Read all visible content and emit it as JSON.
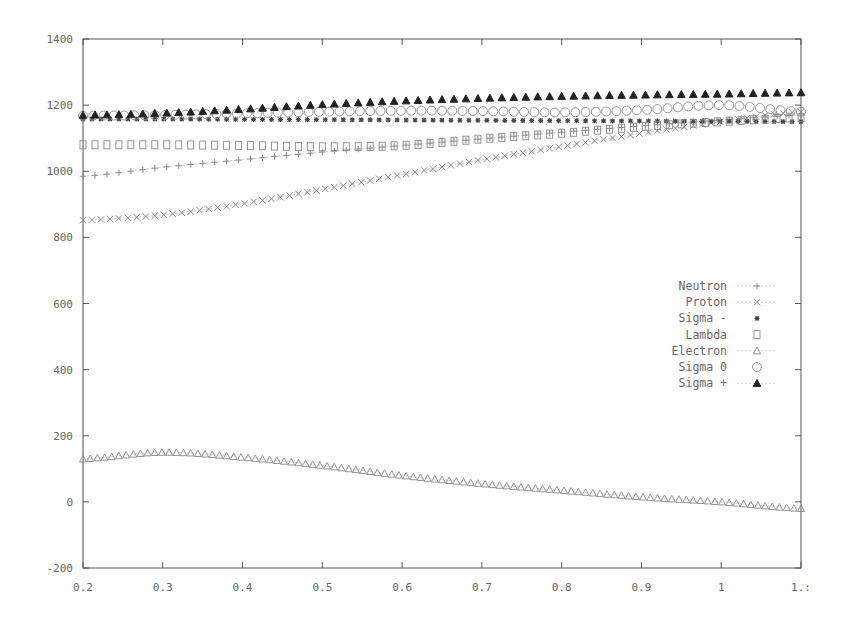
{
  "chart_data": {
    "type": "line",
    "title": "",
    "xlabel": "",
    "ylabel": "",
    "xlim": [
      0.2,
      1.1
    ],
    "ylim": [
      -200,
      1400
    ],
    "grid": false,
    "legend_position": "right-middle",
    "x_ticks": [
      "0.2",
      "0.3",
      "0.4",
      "0.5",
      "0.6",
      "0.7",
      "0.8",
      "0.9",
      "1",
      "1.:"
    ],
    "y_ticks": [
      "-200",
      "0",
      "200",
      "400",
      "600",
      "800",
      "1000",
      "1200",
      "1400"
    ],
    "x": [
      0.2,
      0.3,
      0.4,
      0.5,
      0.6,
      0.7,
      0.8,
      0.9,
      1.0,
      1.1
    ],
    "series": [
      {
        "name": "Neutron",
        "marker": "plus",
        "values": [
          985,
          1012,
          1035,
          1058,
          1078,
          1098,
          1118,
          1137,
          1155,
          1170
        ]
      },
      {
        "name": "Proton",
        "marker": "cross",
        "values": [
          852,
          868,
          902,
          945,
          990,
          1035,
          1075,
          1115,
          1150,
          1180
        ]
      },
      {
        "name": "Sigma -",
        "marker": "star",
        "values": [
          1158,
          1158,
          1157,
          1156,
          1155,
          1154,
          1153,
          1152,
          1151,
          1150
        ]
      },
      {
        "name": "Lambda",
        "marker": "square",
        "values": [
          1080,
          1080,
          1078,
          1074,
          1078,
          1098,
          1115,
          1135,
          1150,
          1162
        ]
      },
      {
        "name": "Electron",
        "marker": "triangle",
        "values": [
          130,
          150,
          135,
          110,
          80,
          55,
          35,
          15,
          0,
          -20
        ]
      },
      {
        "name": "Sigma 0",
        "marker": "circle",
        "values": [
          1168,
          1170,
          1175,
          1180,
          1183,
          1182,
          1178,
          1185,
          1200,
          1180
        ]
      },
      {
        "name": "Sigma +",
        "marker": "filled-triangle",
        "values": [
          1170,
          1176,
          1188,
          1202,
          1213,
          1221,
          1227,
          1231,
          1234,
          1238
        ]
      }
    ]
  },
  "legend": {
    "items": [
      {
        "label": "Neutron"
      },
      {
        "label": "Proton"
      },
      {
        "label": "Sigma -"
      },
      {
        "label": "Lambda"
      },
      {
        "label": "Electron"
      },
      {
        "label": "Sigma 0"
      },
      {
        "label": "Sigma +"
      }
    ]
  },
  "colors": {
    "axis": "#555555",
    "marker": "#8a8a8a",
    "marker_dark": "#222222",
    "text": "#666666"
  }
}
